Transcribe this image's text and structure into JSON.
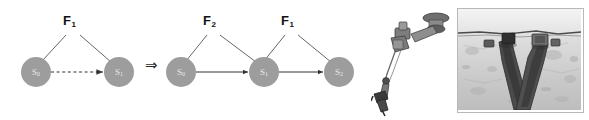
{
  "figure": {
    "implication_symbol": "⇒",
    "colors": {
      "node_fill": "#9d9d9d",
      "node_label": "#e8e8e8",
      "edge": "#4a4a4a",
      "factor_label": "#111111",
      "background": "#ffffff"
    }
  },
  "diagram_left": {
    "name": "single-factor-transition",
    "nodes": [
      {
        "id": "s0",
        "label": "S",
        "subscript": "0"
      },
      {
        "id": "s1",
        "label": "S",
        "subscript": "1"
      }
    ],
    "factors": [
      {
        "id": "f1",
        "label": "F",
        "subscript": "1"
      }
    ],
    "edges": [
      {
        "from": "s0",
        "to": "s1",
        "style": "dashed",
        "arrow": true
      }
    ],
    "factor_links": [
      {
        "factor": "f1",
        "node": "s0"
      },
      {
        "factor": "f1",
        "node": "s1"
      }
    ]
  },
  "diagram_right": {
    "name": "two-factor-transition",
    "nodes": [
      {
        "id": "s0",
        "label": "S",
        "subscript": "0"
      },
      {
        "id": "s1",
        "label": "S",
        "subscript": "1"
      },
      {
        "id": "s2",
        "label": "S",
        "subscript": "2"
      }
    ],
    "factors": [
      {
        "id": "f2",
        "label": "F",
        "subscript": "2"
      },
      {
        "id": "f1",
        "label": "F",
        "subscript": "1"
      }
    ],
    "edges": [
      {
        "from": "s0",
        "to": "s1",
        "style": "solid",
        "arrow": true
      },
      {
        "from": "s1",
        "to": "s2",
        "style": "solid",
        "arrow": true
      }
    ],
    "factor_links": [
      {
        "factor": "f2",
        "node": "s0"
      },
      {
        "factor": "f2",
        "node": "s1"
      },
      {
        "factor": "f1",
        "node": "s1"
      },
      {
        "factor": "f1",
        "node": "s2"
      }
    ]
  },
  "photos": [
    {
      "id": "robot-arm",
      "caption": "",
      "description": "grayscale photograph of an articulated robotic manipulator arm on a white background",
      "framed": false
    },
    {
      "id": "gripper-on-rock",
      "caption": "",
      "description": "grayscale close-up photograph of a two-finger gripper tool contacting a rough rock surface",
      "framed": true
    }
  ]
}
